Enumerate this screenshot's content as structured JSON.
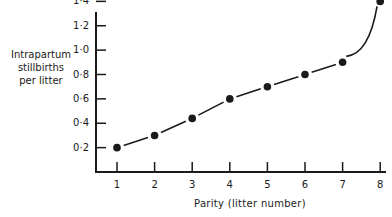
{
  "chart_data": {
    "type": "line",
    "title": "",
    "xlabel": "Parity (litter number)",
    "ylabel": "Intrapartum stillbirths per litter",
    "ylabel_lines": [
      "Intrapartum",
      "stillbirths",
      "per litter"
    ],
    "x": [
      1,
      2,
      3,
      4,
      5,
      6,
      7,
      8
    ],
    "values": [
      0.2,
      0.3,
      0.44,
      0.6,
      0.7,
      0.8,
      0.9,
      1.4
    ],
    "x_ticks": [
      "1",
      "2",
      "3",
      "4",
      "5",
      "6",
      "7",
      "8"
    ],
    "y_ticks": [
      "0·2",
      "0·4",
      "0·6",
      "0·8",
      "1·0",
      "1·2",
      "1·4",
      "1·6"
    ],
    "ylim": [
      0,
      1.6
    ],
    "xlim": [
      0.5,
      8
    ],
    "grid": false,
    "legend": null,
    "line_style": "dashed smooth curve with filled circle markers",
    "colors": {
      "ink": "#1a1a1a",
      "background": "#ffffff"
    }
  }
}
